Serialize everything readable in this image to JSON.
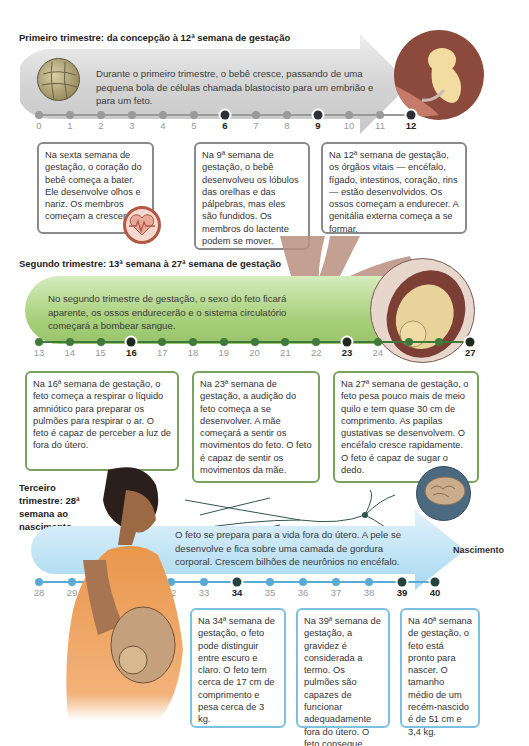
{
  "trimester1": {
    "title": "Primeiro trimestre: da concepção à 12ª semana de gestação",
    "summary": "Durante o primeiro trimestre, o bebê cresce, passando de uma pequena bola de células chamada blastocisto para um embrião e para um feto.",
    "colors": {
      "band": "#d6d6d6",
      "tick": "#9a9a9a",
      "tick_highlight": "#2f2f3a",
      "border": "#8a8a8a"
    },
    "weeks": [
      "0",
      "1",
      "2",
      "3",
      "4",
      "5",
      "6",
      "7",
      "8",
      "9",
      "10",
      "11",
      "12"
    ],
    "highlighted_weeks": [
      "6",
      "9",
      "12"
    ],
    "callouts": [
      {
        "week": "6",
        "text": "Na sexta semana de gestação, o coração do bebê começa a bater. Ele desenvolve olhos e nariz. Os membros começam a crescer.",
        "icon": "heartbeat-icon"
      },
      {
        "week": "9",
        "text": "Na 9ª semana de gestação, o bebê desenvolveu os lóbulos das orelhas e das pálpebras, mas eles são fundidos. Os membros do lactente podem se mover."
      },
      {
        "week": "12",
        "text": "Na 12ª semana de gestação, os órgãos vitais — encéfalo, fígado, intestinos, coração, rins — estão desenvolvidos. Os ossos começam a endurecer. A genitália externa começa a se formar."
      }
    ],
    "illustrations": [
      "blastocyst-illustration",
      "embryo-12-weeks-illustration"
    ]
  },
  "trimester2": {
    "title": "Segundo trimestre: 13ª semana à 27ª semana de gestação",
    "summary": "No segundo trimestre de gestação, o sexo do feto ficará aparente, os ossos endurecerão e o sistema circulatório começará a bombear sangue.",
    "colors": {
      "band": "#a9d17e",
      "tick": "#3f7a3a",
      "tick_highlight": "#1e2b1c",
      "border": "#7aa160"
    },
    "weeks": [
      "13",
      "14",
      "15",
      "16",
      "17",
      "18",
      "19",
      "20",
      "21",
      "22",
      "23",
      "24",
      "",
      "",
      "27"
    ],
    "highlighted_weeks": [
      "16",
      "23",
      "27"
    ],
    "callouts": [
      {
        "week": "16",
        "text": "Na 16ª semana de gestação, o feto começa a respirar o líquido amniótico para preparar os pulmões para respirar o ar. O feto é capaz de perceber a luz de fora do útero."
      },
      {
        "week": "23",
        "text": "Na 23ª semana de gestação, a audição do feto começa a se desenvolver. A mãe começará a sentir os movimentos do feto. O feto é capaz de sentir os movimentos da mãe."
      },
      {
        "week": "27",
        "text": "Na 27ª semana de gestação, o feto pesa pouco mais de meio quilo e tem quase 30 cm de comprimento. As papilas gustativas se desenvolvem. O encéfalo cresce rapidamente. O feto é capaz de sugar o dedo.",
        "icon": "brain-icon"
      }
    ],
    "illustrations": [
      "placenta-vessel-illustration",
      "fetus-in-uterus-illustration"
    ]
  },
  "trimester3": {
    "title": "Terceiro trimestre: 28ª semana ao nascimento",
    "summary": "O feto se prepara para a vida fora do útero. A pele se desenvolve e fica sobre uma camada de gordura corporal. Crescem bilhões de neurônios no encéfalo.",
    "end_label": "Nascimento",
    "colors": {
      "band": "#bfe3f5",
      "tick": "#5aaad6",
      "tick_highlight": "#26433f",
      "border": "#7cc0e2"
    },
    "weeks": [
      "28",
      "29",
      "",
      "",
      "32",
      "33",
      "34",
      "35",
      "36",
      "37",
      "38",
      "39",
      "40"
    ],
    "highlighted_weeks": [
      "34",
      "39",
      "40"
    ],
    "callouts": [
      {
        "week": "34",
        "text": "Na 34ª semana de gestação, o feto pode distinguir entre escuro e claro. O feto tem cerca de 17 cm de comprimento e pesa cerca de 3 kg."
      },
      {
        "week": "39",
        "text": "Na 39ª semana de gestação, a gravidez é considerada a termo. Os pulmões são capazes de funcionar adequadamente fora do útero. O feto consegue pegar objetos."
      },
      {
        "week": "40",
        "text": "Na 40ª semana de gestação, o feto está pronto para nascer. O tamanho médio de um recém-nascido é de 51 cm e 3,4 kg."
      }
    ],
    "illustrations": [
      "neuron-illustration",
      "pregnant-woman-illustration"
    ]
  }
}
